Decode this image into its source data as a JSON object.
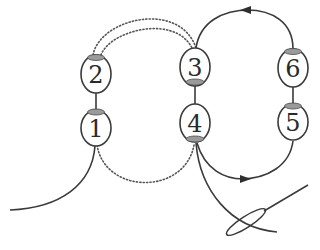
{
  "diagram": {
    "type": "stitch-loop-diagram",
    "colors": {
      "stroke": "#3a3a3a",
      "dotted": "#555555",
      "cap": "#9a9a9a",
      "cap_stroke": "#4a4a4a",
      "background": "#ffffff"
    },
    "nodes": [
      {
        "id": "1",
        "label": "1"
      },
      {
        "id": "2",
        "label": "2"
      },
      {
        "id": "3",
        "label": "3"
      },
      {
        "id": "4",
        "label": "4"
      },
      {
        "id": "5",
        "label": "5"
      },
      {
        "id": "6",
        "label": "6"
      }
    ],
    "connections": [
      {
        "from": "2",
        "to": "1",
        "style": "solid-short"
      },
      {
        "from": "3",
        "to": "4",
        "style": "solid-short"
      },
      {
        "from": "6",
        "to": "5",
        "style": "solid-short"
      },
      {
        "from": "2",
        "to": "3",
        "style": "dotted-double-arc"
      },
      {
        "from": "1",
        "to": "4",
        "style": "dotted-arc"
      },
      {
        "from": "6",
        "to": "3",
        "style": "solid-arc-arrow",
        "arrow_direction": "left"
      },
      {
        "from": "4",
        "to": "5",
        "style": "solid-arc-arrow",
        "arrow_direction": "right"
      }
    ],
    "extras": [
      {
        "name": "tail-thread",
        "description": "thread leaving node 1 to the lower left"
      },
      {
        "name": "needle-thread",
        "description": "thread leaving node 4 through needle eye"
      },
      {
        "name": "needle",
        "description": "needle with elongated eye at lower right"
      }
    ]
  }
}
